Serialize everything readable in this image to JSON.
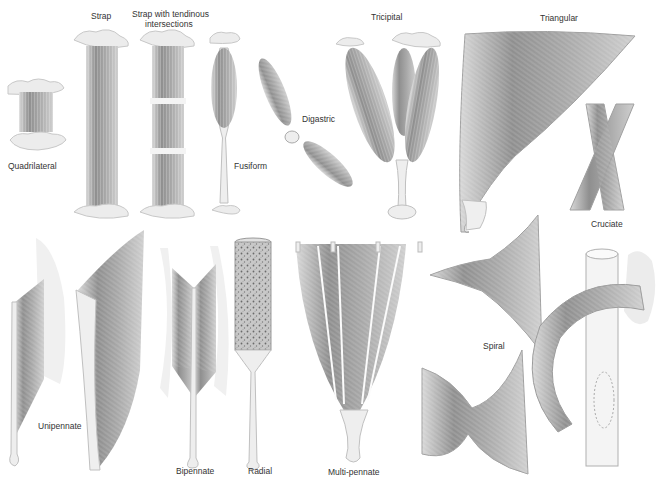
{
  "colors": {
    "muscle_dark": "#8a8a8a",
    "muscle_mid": "#b4b4b4",
    "muscle_light": "#dcdcdc",
    "tendon": "#f0f0f0",
    "outline": "#9a9a9a",
    "label": "#333333"
  },
  "labels": {
    "quadrilateral": "Quadrilateral",
    "strap": "Strap",
    "strap_tendinous_1": "Strap with tendinous",
    "strap_tendinous_2": "intersections",
    "fusiform": "Fusiform",
    "digastric": "Digastric",
    "tricipital": "Tricipital",
    "triangular": "Triangular",
    "cruciate": "Cruciate",
    "unipennate": "Unipennate",
    "bipennate": "Bipennate",
    "radial": "Radial",
    "multipennate": "Multi-pennate",
    "spiral": "Spiral"
  }
}
